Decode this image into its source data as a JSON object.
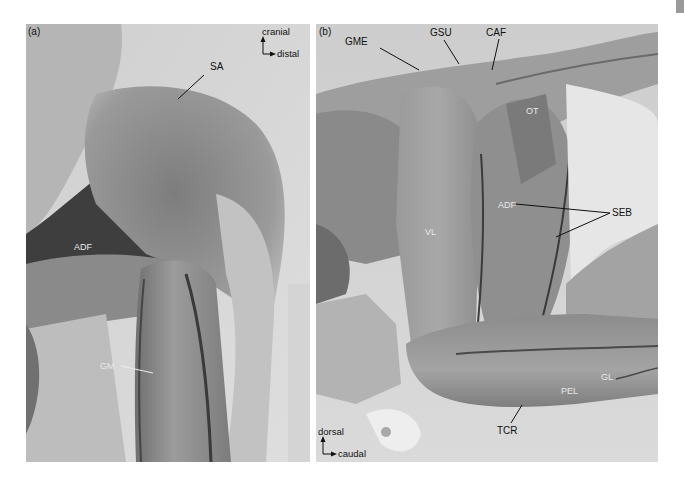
{
  "figure": {
    "panels": [
      {
        "id": "(a)",
        "orientation": {
          "up": "cranial",
          "right": "distal"
        },
        "labels": [
          {
            "text": "SA",
            "style": "dark"
          },
          {
            "text": "ADF",
            "style": "light"
          },
          {
            "text": "GM",
            "style": "light"
          }
        ]
      },
      {
        "id": "(b)",
        "orientation": {
          "up": "dorsal",
          "right": "caudal"
        },
        "labels": [
          {
            "text": "GME",
            "style": "dark"
          },
          {
            "text": "GSU",
            "style": "dark"
          },
          {
            "text": "CAF",
            "style": "dark"
          },
          {
            "text": "OT",
            "style": "light"
          },
          {
            "text": "SEB",
            "style": "dark"
          },
          {
            "text": "ADF",
            "style": "light"
          },
          {
            "text": "VL",
            "style": "light"
          },
          {
            "text": "GL",
            "style": "light"
          },
          {
            "text": "PEL",
            "style": "light"
          },
          {
            "text": "TCR",
            "style": "dark"
          }
        ]
      }
    ]
  }
}
